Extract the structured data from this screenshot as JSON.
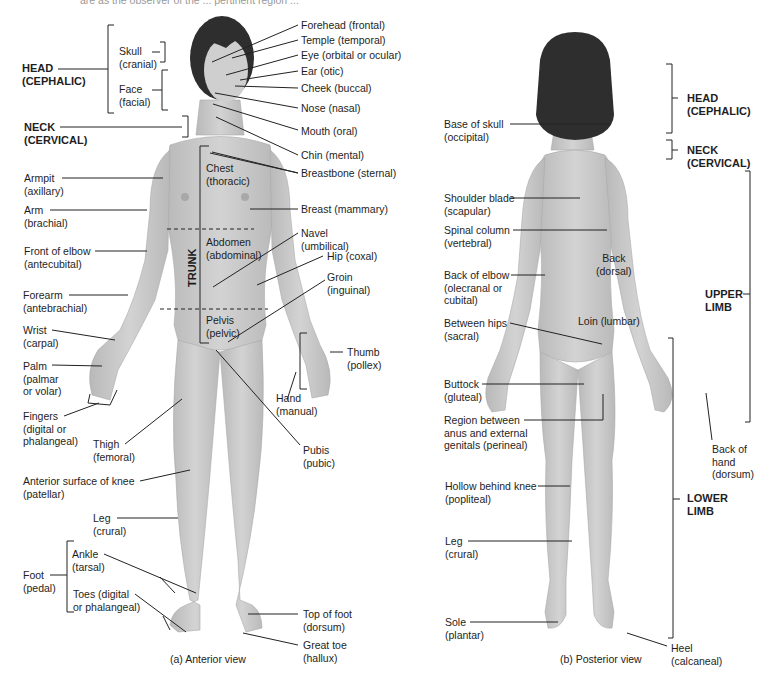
{
  "figure": {
    "top_fragment": "are as the observer of the ... pertinent region ...",
    "anterior": {
      "caption": "(a) Anterior view",
      "regions_left": [
        {
          "id": "head",
          "line1": "HEAD",
          "line2": "(CEPHALIC)",
          "bold": true
        },
        {
          "id": "skull",
          "line1": "Skull",
          "line2": "(cranial)"
        },
        {
          "id": "face",
          "line1": "Face",
          "line2": "(facial)"
        },
        {
          "id": "neck",
          "line1": "NECK",
          "line2": "(CERVICAL)",
          "bold": true
        },
        {
          "id": "armpit",
          "line1": "Armpit",
          "line2": "(axillary)"
        },
        {
          "id": "arm",
          "line1": "Arm",
          "line2": "(brachial)"
        },
        {
          "id": "front-of-elbow",
          "line1": "Front of elbow",
          "line2": "(antecubital)"
        },
        {
          "id": "forearm",
          "line1": "Forearm",
          "line2": "(antebrachial)"
        },
        {
          "id": "wrist",
          "line1": "Wrist",
          "line2": "(carpal)"
        },
        {
          "id": "palm",
          "line1": "Palm",
          "line2": "(palmar",
          "line3": "or volar)"
        },
        {
          "id": "fingers",
          "line1": "Fingers",
          "line2": "(digital or",
          "line3": "phalangeal)"
        },
        {
          "id": "thigh",
          "line1": "Thigh",
          "line2": "(femoral)"
        },
        {
          "id": "knee",
          "line1": "Anterior surface of knee",
          "line2": "(patellar)"
        },
        {
          "id": "leg",
          "line1": "Leg",
          "line2": "(crural)"
        },
        {
          "id": "foot",
          "line1": "Foot",
          "line2": "(pedal)"
        },
        {
          "id": "ankle",
          "line1": "Ankle",
          "line2": "(tarsal)"
        },
        {
          "id": "toes",
          "line1": "Toes (digital",
          "line2": "or phalangeal)"
        }
      ],
      "regions_right": [
        {
          "id": "forehead",
          "line1": "Forehead (frontal)"
        },
        {
          "id": "temple",
          "line1": "Temple (temporal)"
        },
        {
          "id": "eye",
          "line1": "Eye (orbital or ocular)"
        },
        {
          "id": "ear",
          "line1": "Ear (otic)"
        },
        {
          "id": "cheek",
          "line1": "Cheek (buccal)"
        },
        {
          "id": "nose",
          "line1": "Nose (nasal)"
        },
        {
          "id": "mouth",
          "line1": "Mouth (oral)"
        },
        {
          "id": "chin",
          "line1": "Chin (mental)"
        },
        {
          "id": "breastbone",
          "line1": "Breastbone (sternal)"
        },
        {
          "id": "breast",
          "line1": "Breast (mammary)"
        },
        {
          "id": "navel",
          "line1": "Navel",
          "line2": "(umbilical)"
        },
        {
          "id": "hip",
          "line1": "Hip (coxal)"
        },
        {
          "id": "groin",
          "line1": "Groin",
          "line2": "(inguinal)"
        },
        {
          "id": "thumb",
          "line1": "Thumb",
          "line2": "(pollex)"
        },
        {
          "id": "hand",
          "line1": "Hand",
          "line2": "(manual)"
        },
        {
          "id": "pubis",
          "line1": "Pubis",
          "line2": "(pubic)"
        },
        {
          "id": "top-of-foot",
          "line1": "Top of foot",
          "line2": "(dorsum)"
        },
        {
          "id": "great-toe",
          "line1": "Great toe",
          "line2": "(hallux)"
        }
      ],
      "trunk_regions": [
        {
          "id": "chest",
          "line1": "Chest",
          "line2": "(thoracic)"
        },
        {
          "id": "abdomen",
          "line1": "Abdomen",
          "line2": "(abdominal)"
        },
        {
          "id": "pelvis",
          "line1": "Pelvis",
          "line2": "(pelvic)"
        }
      ],
      "trunk_label": "TRUNK"
    },
    "posterior": {
      "caption": "(b) Posterior view",
      "regions_left": [
        {
          "id": "base-of-skull",
          "line1": "Base of skull",
          "line2": "(occipital)"
        },
        {
          "id": "shoulder-blade",
          "line1": "Shoulder blade",
          "line2": "(scapular)"
        },
        {
          "id": "spinal-column",
          "line1": "Spinal column",
          "line2": "(vertebral)"
        },
        {
          "id": "back-of-elbow",
          "line1": "Back of elbow",
          "line2": "(olecranal or",
          "line3": "cubital)"
        },
        {
          "id": "between-hips",
          "line1": "Between hips",
          "line2": "(sacral)"
        },
        {
          "id": "buttock",
          "line1": "Buttock",
          "line2": "(gluteal)"
        },
        {
          "id": "perineal",
          "line1": "Region between",
          "line2": "anus and external",
          "line3": "genitals (perineal)"
        },
        {
          "id": "hollow-knee",
          "line1": "Hollow behind knee",
          "line2": "(popliteal)"
        },
        {
          "id": "leg",
          "line1": "Leg",
          "line2": "(crural)"
        },
        {
          "id": "sole",
          "line1": "Sole",
          "line2": "(plantar)"
        }
      ],
      "regions_body": [
        {
          "id": "back",
          "line1": "Back",
          "line2": "(dorsal)"
        },
        {
          "id": "loin",
          "line1": "Loin (lumbar)"
        }
      ],
      "regions_right": [
        {
          "id": "head",
          "line1": "HEAD",
          "line2": "(CEPHALIC)",
          "bold": true
        },
        {
          "id": "neck",
          "line1": "NECK",
          "line2": "(CERVICAL)",
          "bold": true
        },
        {
          "id": "upper-limb",
          "line1": "UPPER",
          "line2": "LIMB",
          "bold": true
        },
        {
          "id": "back-of-hand",
          "line1": "Back of",
          "line2": "hand",
          "line3": "(dorsum)"
        },
        {
          "id": "lower-limb",
          "line1": "LOWER",
          "line2": "LIMB",
          "bold": true
        },
        {
          "id": "heel",
          "line1": "Heel",
          "line2": "(calcaneal)"
        }
      ]
    },
    "colors": {
      "skin": "#c9c9c9",
      "skin_shade": "#b4b4b4",
      "hair": "#2e2e2e",
      "line": "#222222",
      "text": "#1e1e1e"
    }
  }
}
